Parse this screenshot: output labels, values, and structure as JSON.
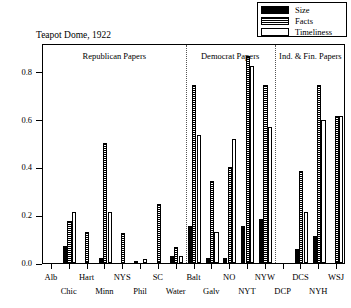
{
  "chart_data": {
    "type": "bar",
    "title": "Teapot Dome, 1922",
    "xlabel": "",
    "ylabel": "",
    "ylim": [
      0.0,
      0.92
    ],
    "yticks": [
      0.0,
      0.2,
      0.4,
      0.6,
      0.8
    ],
    "ytick_labels": [
      "0.0",
      "0.2",
      "0.4",
      "0.6",
      "0.8"
    ],
    "grid": false,
    "legend_position": "top-right",
    "categories": [
      "Alb",
      "Chic",
      "Hart",
      "Minn",
      "NYS",
      "Phil",
      "SC",
      "Water",
      "Balt",
      "Galv",
      "NO",
      "NYT",
      "NYW",
      "DCP",
      "DCS",
      "NYH",
      "WSJ"
    ],
    "series": [
      {
        "name": "Size",
        "color": "#000000",
        "pattern": "solid",
        "values": [
          0.0,
          0.07,
          0.0,
          0.02,
          0.0,
          0.01,
          0.0,
          0.03,
          0.155,
          0.02,
          0.02,
          0.155,
          0.185,
          0.0,
          0.06,
          0.115,
          0.0
        ]
      },
      {
        "name": "Facts",
        "color": "#000000",
        "pattern": "horizontal-stripes",
        "values": [
          0.0,
          0.175,
          0.13,
          0.5,
          0.125,
          0.0,
          0.245,
          0.065,
          0.745,
          0.345,
          0.4,
          0.865,
          0.745,
          0.0,
          0.385,
          0.745,
          0.615
        ]
      },
      {
        "name": "Timeliness",
        "color": "#ffffff",
        "pattern": "open",
        "values": [
          0.0,
          0.215,
          0.0,
          0.215,
          0.0,
          0.015,
          0.0,
          0.03,
          0.535,
          0.13,
          0.52,
          0.825,
          0.57,
          0.0,
          0.215,
          0.6,
          0.615
        ]
      }
    ],
    "groups": [
      {
        "label": "Republican Papers",
        "start": 0,
        "end": 7
      },
      {
        "label": "Democrat Papers",
        "start": 8,
        "end": 12
      },
      {
        "label": "Ind. & Fin. Papers",
        "start": 13,
        "end": 16
      }
    ]
  },
  "legend": {
    "items": [
      {
        "label": "Size",
        "icon": "solid-black-swatch"
      },
      {
        "label": "Facts",
        "icon": "striped-swatch"
      },
      {
        "label": "Timeliness",
        "icon": "open-swatch"
      }
    ]
  }
}
